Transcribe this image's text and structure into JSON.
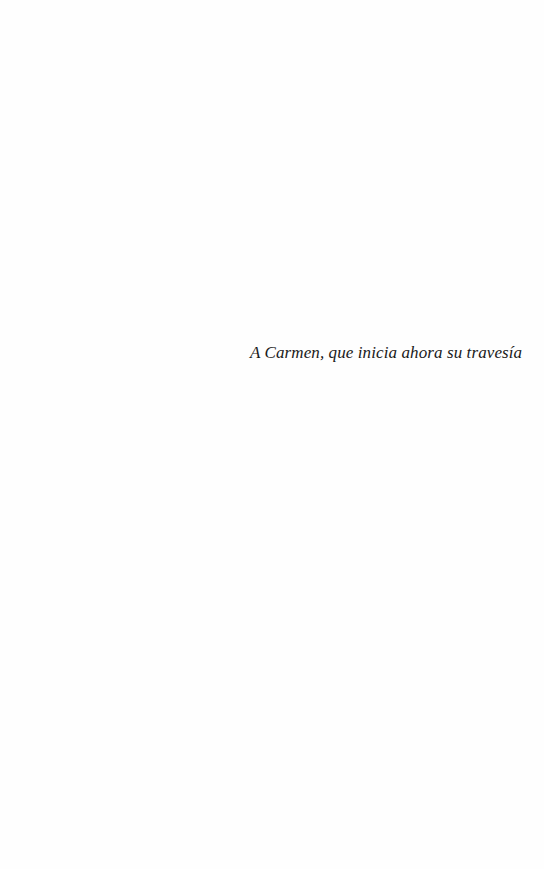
{
  "page": {
    "type": "dedication",
    "dedication_text": "A Carmen, que inicia ahora su travesía"
  }
}
